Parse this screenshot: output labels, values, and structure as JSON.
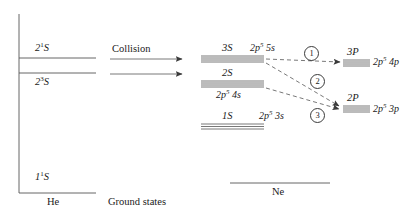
{
  "figure": {
    "type": "energy-level-diagram",
    "background": "#ffffff",
    "line_color": "#555555",
    "text_color": "#1a1a1a"
  },
  "helium": {
    "axis_name": "helium-energy-axis",
    "species_label": "He",
    "levels": [
      {
        "name": "he-level-2-1-S",
        "term": "2",
        "super": "1",
        "orbital": "S",
        "label_position": "above"
      },
      {
        "name": "he-level-2-3-S",
        "term": "2",
        "super": "3",
        "orbital": "S",
        "label_position": "below"
      },
      {
        "name": "he-level-1-1-S",
        "term": "1",
        "super": "1",
        "orbital": "S",
        "label_position": "above"
      }
    ]
  },
  "collision": {
    "label": "Collision",
    "arrow_count": 2
  },
  "ground_states": {
    "label": "Ground states"
  },
  "neon": {
    "species_label": "Ne",
    "level_groups": [
      {
        "name": "ne-group-3S",
        "term": "3S",
        "config_prefix": "2",
        "config_mid": "p",
        "config_sup": "5",
        "config_suffix": "5s",
        "lines": 4
      },
      {
        "name": "ne-group-2S",
        "term": "2S",
        "config_prefix": "2",
        "config_mid": "p",
        "config_sup": "5",
        "config_suffix": "4s",
        "lines": 4
      },
      {
        "name": "ne-group-1S",
        "term": "1S",
        "config_prefix": "2",
        "config_mid": "p",
        "config_sup": "5",
        "config_suffix": "3s",
        "lines": 3
      },
      {
        "name": "ne-group-3P",
        "term": "3P",
        "config_prefix": "2",
        "config_mid": "p",
        "config_sup": "5",
        "config_suffix": "4p",
        "lines": 4
      },
      {
        "name": "ne-group-2P",
        "term": "2P",
        "config_prefix": "2",
        "config_mid": "p",
        "config_sup": "5",
        "config_suffix": "3p",
        "lines": 4
      }
    ]
  },
  "transitions": [
    {
      "name": "transition-1",
      "number": "1",
      "from": "3S",
      "to": "3P"
    },
    {
      "name": "transition-2",
      "number": "2",
      "from": "3S",
      "to": "2P"
    },
    {
      "name": "transition-3",
      "number": "3",
      "from": "2S",
      "to": "2P"
    }
  ]
}
